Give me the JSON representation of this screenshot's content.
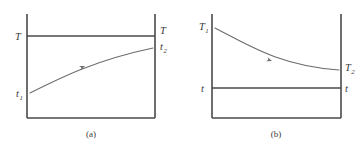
{
  "figure": {
    "background_color": "#ffffff",
    "line_color": "#4a4a4a",
    "curve_color": "#6b6b6b",
    "text_color": "#3a3a3a"
  },
  "panels": [
    {
      "id": "a",
      "caption": "(a)",
      "caption_x": 91,
      "caption_y": 137,
      "frame": {
        "left_x": 27,
        "right_x": 155,
        "top_y": 14,
        "bottom_y": 118
      },
      "level_line": {
        "label_left": "T",
        "label_right": "T",
        "sub_left": "",
        "sub_right": "",
        "y": 36
      },
      "curve": {
        "start_label": "t",
        "start_sub": "1",
        "end_label": "t",
        "end_sub": "2",
        "start_x": 30,
        "start_y": 93,
        "end_x": 153,
        "end_y": 48,
        "shape": "rising-concave-down",
        "path": "M 30 93 C 62 77, 96 60, 153 48",
        "arrow_x": 85,
        "arrow_y": 66,
        "arrow_angle": -22
      },
      "labels": [
        {
          "text": "T",
          "sub": "",
          "x": 15,
          "y": 40,
          "name": "label-T-left"
        },
        {
          "text": "T",
          "sub": "",
          "x": 160,
          "y": 34,
          "name": "label-T-right"
        },
        {
          "text": "t",
          "sub": "1",
          "x": 16,
          "y": 97,
          "name": "label-t1"
        },
        {
          "text": "t",
          "sub": "2",
          "x": 160,
          "y": 50,
          "name": "label-t2"
        }
      ]
    },
    {
      "id": "b",
      "caption": "(b)",
      "caption_x": 276,
      "caption_y": 137,
      "frame": {
        "left_x": 212,
        "right_x": 341,
        "top_y": 14,
        "bottom_y": 118
      },
      "level_line": {
        "label_left": "t",
        "label_right": "t",
        "sub_left": "",
        "sub_right": "",
        "y": 88
      },
      "curve": {
        "start_label": "T",
        "start_sub": "1",
        "end_label": "T",
        "end_sub": "2",
        "start_x": 215,
        "start_y": 28,
        "end_x": 339,
        "end_y": 70,
        "shape": "falling-convex",
        "path": "M 215 28 C 248 45, 280 66, 339 70",
        "arrow_x": 272,
        "arrow_y": 61,
        "arrow_angle": 20
      },
      "labels": [
        {
          "text": "T",
          "sub": "1",
          "x": 199,
          "y": 30,
          "name": "label-T1"
        },
        {
          "text": "T",
          "sub": "2",
          "x": 345,
          "y": 71,
          "name": "label-T2"
        },
        {
          "text": "t",
          "sub": "",
          "x": 201,
          "y": 92,
          "name": "label-t-left"
        },
        {
          "text": "t",
          "sub": "",
          "x": 345,
          "y": 92,
          "name": "label-t-right"
        }
      ]
    }
  ]
}
